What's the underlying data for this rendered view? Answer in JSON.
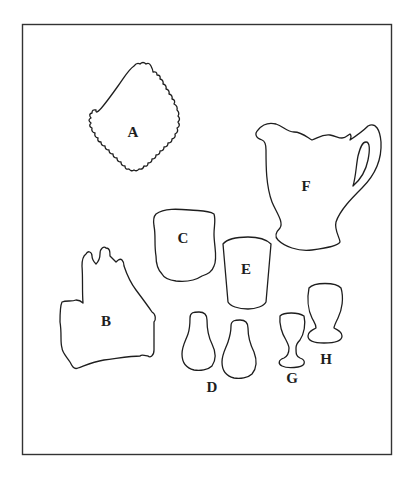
{
  "figure": {
    "frame": {
      "x": 22,
      "y": 24,
      "width": 370,
      "height": 431
    },
    "items": [
      {
        "id": "A",
        "label": "A",
        "description": "square plate with scalloped edges"
      },
      {
        "id": "B",
        "label": "B",
        "description": "irregular castle-shaped dish"
      },
      {
        "id": "C",
        "label": "C",
        "description": "bowl / cup"
      },
      {
        "id": "D",
        "label": "D",
        "description": "pair of salt and pepper shakers"
      },
      {
        "id": "E",
        "label": "E",
        "description": "tumbler"
      },
      {
        "id": "F",
        "label": "F",
        "description": "pitcher with handle"
      },
      {
        "id": "G",
        "label": "G",
        "description": "small stemmed cordial glass"
      },
      {
        "id": "H",
        "label": "H",
        "description": "footed goblet"
      }
    ]
  },
  "labels": {
    "A": "A",
    "B": "B",
    "C": "C",
    "D": "D",
    "E": "E",
    "F": "F",
    "G": "G",
    "H": "H"
  }
}
